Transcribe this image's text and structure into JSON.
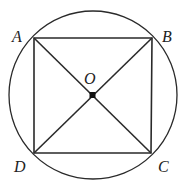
{
  "diagram": {
    "type": "geometry",
    "circle": {
      "cx": 93,
      "cy": 95,
      "r": 84,
      "stroke": "#2a2a2a"
    },
    "square": {
      "vertices": {
        "A": [
          34,
          38
        ],
        "B": [
          152,
          38
        ],
        "C": [
          151,
          153
        ],
        "D": [
          34,
          153
        ]
      },
      "stroke": "#2a2a2a"
    },
    "diagonals": [
      "AC",
      "BD"
    ],
    "center_point": {
      "name": "O",
      "pos": [
        92,
        95
      ]
    },
    "labels": {
      "A": "A",
      "B": "B",
      "C": "C",
      "D": "D",
      "O": "O"
    }
  }
}
